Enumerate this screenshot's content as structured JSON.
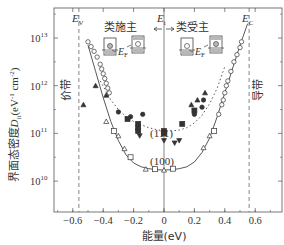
{
  "chart_data": {
    "type": "scatter",
    "title": "",
    "xlabel": "能量(eV)",
    "ylabel": "界面态密度D_it(eV^-1 cm^-2)",
    "ylabel_parts": {
      "main": "界面态密度",
      "sym": "D",
      "sub": "it",
      "unit": "(eV",
      "exp1": "-1",
      "cm": " cm",
      "exp2": "-2",
      "close": ")"
    },
    "xlim": [
      -0.72,
      0.78
    ],
    "ylim_log10": [
      9.4,
      13.6
    ],
    "yscale": "log",
    "x_ticks": [
      {
        "v": -0.6,
        "label": "−0.6"
      },
      {
        "v": -0.4,
        "label": "−0.4"
      },
      {
        "v": -0.2,
        "label": "−0.2"
      },
      {
        "v": 0,
        "label": "0"
      },
      {
        "v": 0.2,
        "label": "0.2"
      },
      {
        "v": 0.4,
        "label": "0.4"
      },
      {
        "v": 0.6,
        "label": "0.6"
      }
    ],
    "y_ticks": [
      {
        "exp": 13,
        "base": "10",
        "sup": "13"
      },
      {
        "exp": 12,
        "base": "10",
        "sup": "12"
      },
      {
        "exp": 11,
        "base": "10",
        "sup": "11"
      },
      {
        "exp": 10,
        "base": "10",
        "sup": "10"
      }
    ],
    "grid": false,
    "vertical_lines": [
      {
        "x": -0.56,
        "label": "E_V",
        "sym": "E",
        "sub": "V",
        "style": "dashed"
      },
      {
        "x": 0.0,
        "label": "E_i",
        "sym": "E",
        "sub": "i",
        "style": "solid"
      },
      {
        "x": 0.56,
        "label": "E_C",
        "sym": "E",
        "sub": "C",
        "style": "dashed"
      }
    ],
    "annotations": {
      "donor_like": "类施主",
      "acceptor_like": "类受主",
      "valence_band": "价带",
      "conduction_band": "导带",
      "fermi_label_sym": "E",
      "fermi_label_sub": "F",
      "label_111": "(111)",
      "label_100": "(100)"
    },
    "series": [
      {
        "name": "(100) fit",
        "kind": "line-solid",
        "x": [
          -0.5,
          -0.45,
          -0.4,
          -0.35,
          -0.3,
          -0.25,
          -0.2,
          -0.15,
          -0.1,
          -0.05,
          0,
          0.05,
          0.1,
          0.15,
          0.2,
          0.25,
          0.3,
          0.35,
          0.4,
          0.45,
          0.5,
          0.55
        ],
        "log10_y": [
          12.85,
          12.3,
          11.75,
          11.25,
          10.85,
          10.55,
          10.38,
          10.3,
          10.26,
          10.24,
          10.23,
          10.24,
          10.26,
          10.3,
          10.4,
          10.6,
          10.9,
          11.35,
          11.85,
          12.35,
          12.85,
          13.3
        ]
      },
      {
        "name": "(111) fit",
        "kind": "line-dotted",
        "x": [
          -0.42,
          -0.35,
          -0.3,
          -0.25,
          -0.2,
          -0.15,
          -0.1,
          -0.05,
          0,
          0.05,
          0.1,
          0.15,
          0.2,
          0.25,
          0.3,
          0.35,
          0.4
        ],
        "log10_y": [
          12.1,
          11.7,
          11.5,
          11.35,
          11.25,
          11.18,
          11.12,
          11.08,
          11.05,
          11.05,
          11.07,
          11.12,
          11.22,
          11.38,
          11.62,
          11.95,
          12.4
        ]
      },
      {
        "name": "(100) circles",
        "marker": "circle-open",
        "x": [
          -0.5,
          -0.48,
          -0.46,
          -0.44,
          -0.42,
          -0.41,
          -0.4,
          -0.39,
          -0.38,
          -0.37,
          -0.36,
          0.36,
          0.38,
          0.39,
          0.4,
          0.41,
          0.42,
          0.44,
          0.46,
          0.48,
          0.5,
          0.51
        ],
        "log10_y": [
          12.92,
          12.82,
          12.72,
          12.6,
          12.45,
          12.35,
          12.25,
          12.15,
          12.05,
          11.95,
          11.85,
          11.4,
          11.6,
          11.7,
          11.85,
          12.0,
          12.1,
          12.3,
          12.5,
          12.65,
          12.8,
          12.92
        ]
      },
      {
        "name": "(100) squares",
        "marker": "square-open",
        "x": [
          -0.33,
          -0.22,
          -0.06,
          0.06,
          0.33
        ],
        "log10_y": [
          11.05,
          10.5,
          10.25,
          10.26,
          11.05
        ]
      },
      {
        "name": "(100) triangles",
        "marker": "triangle-open",
        "x": [
          -0.38,
          -0.3,
          -0.26,
          -0.12,
          0,
          0.26,
          0.3
        ],
        "log10_y": [
          11.25,
          10.95,
          10.68,
          10.25,
          10.23,
          10.7,
          10.95
        ]
      },
      {
        "name": "(111) filled triangles",
        "marker": "triangle-filled",
        "x": [
          -0.45,
          -0.53,
          -0.38,
          0.18,
          0.22,
          0.27
        ],
        "log10_y": [
          12.0,
          11.6,
          11.8,
          11.6,
          11.7,
          11.85
        ]
      },
      {
        "name": "(111) filled circles",
        "marker": "circle-filled",
        "x": [
          -0.3,
          -0.22,
          -0.14,
          0.2,
          0.25,
          0.26
        ],
        "log10_y": [
          11.45,
          11.35,
          11.4,
          11.4,
          11.55,
          11.7
        ]
      },
      {
        "name": "(111) filled squares",
        "marker": "square-filled",
        "x": [
          -0.24,
          -0.17,
          -0.17,
          -0.17,
          0.0,
          0.0,
          0.12,
          0.2
        ],
        "log10_y": [
          11.3,
          11.2,
          11.12,
          11.05,
          11.05,
          11.0,
          11.2,
          11.48
        ]
      },
      {
        "name": "(111) filled inverted triangles",
        "marker": "triangle-down-filled",
        "x": [
          -0.16,
          0.0,
          0.07,
          0.1
        ],
        "log10_y": [
          10.95,
          10.85,
          10.8,
          10.85
        ]
      }
    ]
  }
}
